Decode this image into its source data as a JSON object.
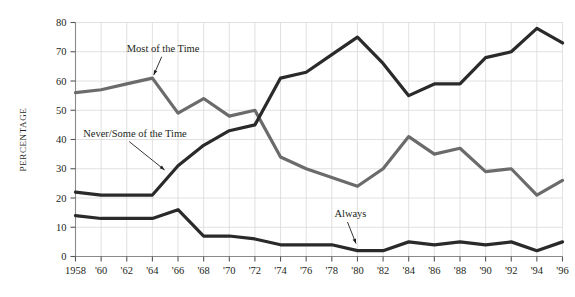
{
  "chart_data": {
    "type": "line",
    "title": "",
    "subtitle": "",
    "xlabel": "",
    "ylabel": "PERCENTAGE",
    "ylim": [
      0,
      80
    ],
    "yticks": [
      0,
      10,
      20,
      30,
      40,
      50,
      60,
      70,
      80
    ],
    "ytick_labels": [
      "0",
      "10",
      "20",
      "30",
      "40",
      "50",
      "60",
      "70",
      "80"
    ],
    "grid": true,
    "legend_position": "inline-annotations",
    "x": [
      1958,
      1960,
      1962,
      1964,
      1966,
      1968,
      1970,
      1972,
      1974,
      1976,
      1978,
      1980,
      1982,
      1984,
      1986,
      1988,
      1990,
      1992,
      1994,
      1996
    ],
    "xtick_labels": [
      "1958",
      "'60",
      "'62",
      "'64",
      "'66",
      "'68",
      "'70",
      "'72",
      "'74",
      "'76",
      "'78",
      "'80",
      "'82",
      "'84",
      "'86",
      "'88",
      "'90",
      "'92",
      "'94",
      "'96"
    ],
    "series": [
      {
        "name": "Most of the Time",
        "color": "#6b6b6b",
        "values": [
          56,
          57,
          59,
          61,
          49,
          54,
          48,
          50,
          34,
          30,
          27,
          24,
          30,
          41,
          35,
          37,
          29,
          30,
          21,
          26
        ]
      },
      {
        "name": "Never/Some of the Time",
        "color": "#2a2a2a",
        "values": [
          22,
          21,
          21,
          21,
          31,
          38,
          43,
          45,
          61,
          63,
          69,
          75,
          66,
          55,
          59,
          59,
          68,
          70,
          78,
          73
        ]
      },
      {
        "name": "Always",
        "color": "#2a2a2a",
        "values": [
          14,
          13,
          13,
          13,
          16,
          7,
          7,
          6,
          4,
          4,
          4,
          2,
          2,
          5,
          4,
          5,
          4,
          5,
          2,
          5
        ]
      }
    ],
    "annotations": [
      {
        "label": "Most of the Time",
        "text_x": 1962.0,
        "text_y": 70.0,
        "point_x": 1964.0,
        "point_y": 61.0
      },
      {
        "label": "Never/Some of the Time",
        "text_x": 1958.6,
        "text_y": 41.0,
        "point_x": 1965.4,
        "point_y": 28.0
      },
      {
        "label": "Always",
        "text_x": 1978.2,
        "text_y": 13.5,
        "point_x": 1980.0,
        "point_y": 3.2
      }
    ]
  }
}
